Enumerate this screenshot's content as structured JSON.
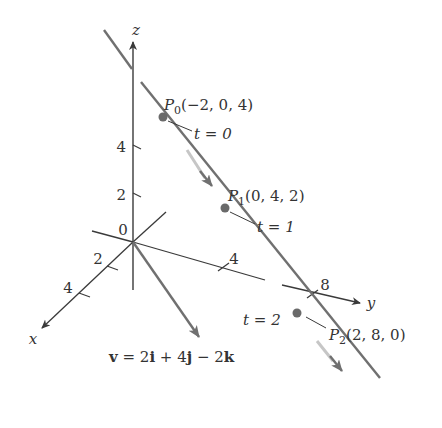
{
  "figure": {
    "axes": {
      "x": {
        "label": "x",
        "ticks": [
          "2",
          "4"
        ]
      },
      "y": {
        "label": "y",
        "ticks": [
          "4",
          "8"
        ]
      },
      "z": {
        "label": "z",
        "ticks": [
          "2",
          "4"
        ]
      },
      "origin_label": "0"
    },
    "points": [
      {
        "name": "P",
        "sub": "0",
        "coords": "(−2, 0, 4)",
        "param": "t = 0"
      },
      {
        "name": "P",
        "sub": "1",
        "coords": "(0, 4, 2)",
        "param": "t = 1"
      },
      {
        "name": "P",
        "sub": "2",
        "coords": "(2, 8, 0)",
        "param": "t = 2"
      }
    ],
    "vector": {
      "v": "v",
      "eq": " = 2",
      "i": "i",
      "plus": " + 4",
      "j": "j",
      "minus": " − 2",
      "k": "k"
    },
    "colors": {
      "axis": "#3a3a3a",
      "line": "#707070",
      "point": "#6a6a6a",
      "highlight": "#b8b8b8",
      "text": "#333333"
    }
  }
}
